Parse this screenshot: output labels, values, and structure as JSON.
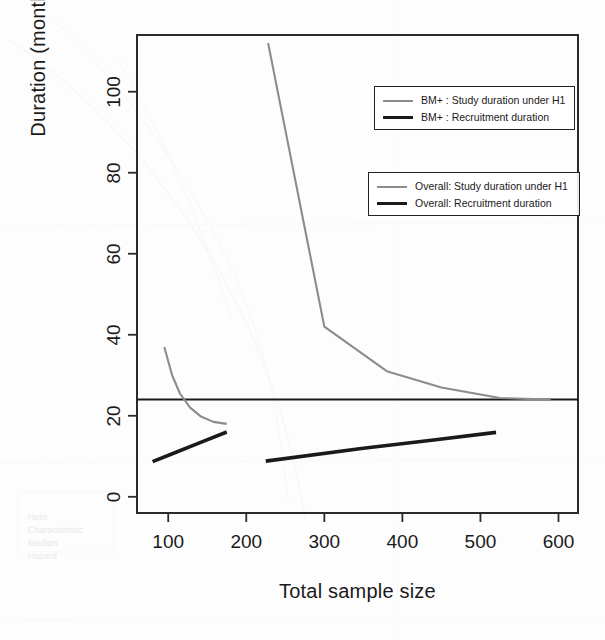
{
  "chart_data": {
    "type": "line",
    "title": "",
    "xlabel": "Total sample size",
    "ylabel": "Duration (months)",
    "xlim": [
      60,
      625
    ],
    "ylim": [
      -4,
      114
    ],
    "xticks": [
      100,
      200,
      300,
      400,
      500,
      600
    ],
    "yticks": [
      0,
      20,
      40,
      60,
      80,
      100
    ],
    "grid": false,
    "legend_position": "top-right",
    "annotations": [
      {
        "name": "target-duration-reference-line",
        "type": "hline",
        "y": 24,
        "color": "#1a1a1a"
      }
    ],
    "series": [
      {
        "name": "BM+ : Study duration under H1",
        "style": "gray-thin",
        "color": "#8c8c8c",
        "x": [
          95,
          105,
          115,
          128,
          142,
          158,
          175
        ],
        "y": [
          37.0,
          30.0,
          25.5,
          22.0,
          19.8,
          18.5,
          18.0
        ]
      },
      {
        "name": "BM+ : Recruitment duration",
        "style": "black-thick",
        "color": "#1a1a1a",
        "x": [
          80,
          110,
          140,
          175
        ],
        "y": [
          8.7,
          11.0,
          13.3,
          16.0
        ]
      },
      {
        "name": "Overall: Study duration under H1",
        "style": "gray-thin",
        "color": "#8c8c8c",
        "x": [
          228,
          300,
          380,
          450,
          525,
          590
        ],
        "y": [
          112.0,
          42.0,
          31.0,
          27.0,
          24.4,
          24.0
        ]
      },
      {
        "name": "Overall: Recruitment duration",
        "style": "black-thick",
        "color": "#1a1a1a",
        "x": [
          225,
          350,
          440,
          520
        ],
        "y": [
          8.8,
          12.0,
          14.0,
          15.9
        ]
      }
    ]
  },
  "legends": [
    {
      "name": "bmplus-legend",
      "entries": [
        {
          "label": "BM+ : Study duration under H1",
          "swatch": "gray"
        },
        {
          "label": "BM+ : Recruitment duration",
          "swatch": "black"
        }
      ]
    },
    {
      "name": "overall-legend",
      "entries": [
        {
          "label": "Overall: Study duration under H1",
          "swatch": "gray"
        },
        {
          "label": "Overall: Recruitment duration",
          "swatch": "black"
        }
      ]
    }
  ],
  "axes": {
    "x_title": "Total sample size",
    "y_title": "Duration (months)",
    "x_tick_labels": [
      "100",
      "200",
      "300",
      "400",
      "500",
      "600"
    ],
    "y_tick_labels": [
      "0",
      "20",
      "40",
      "60",
      "80",
      "100"
    ]
  }
}
